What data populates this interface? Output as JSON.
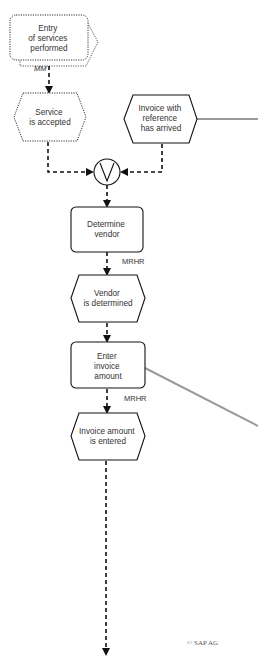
{
  "diagram": {
    "type": "EPC process chain",
    "nodes": [
      {
        "id": "entry-of-services",
        "kind": "process-interface",
        "style": "dotted",
        "lines": [
          "Entry",
          "of services",
          "performed"
        ]
      },
      {
        "id": "service-accepted",
        "kind": "event",
        "style": "dotted",
        "lines": [
          "Service",
          "is accepted"
        ]
      },
      {
        "id": "invoice-arrived",
        "kind": "event",
        "style": "solid",
        "lines": [
          "Invoice with",
          "reference",
          "has arrived"
        ]
      },
      {
        "id": "xor-connector",
        "kind": "connector",
        "symbol": "V"
      },
      {
        "id": "determine-vendor",
        "kind": "function",
        "style": "solid",
        "lines": [
          "Determine",
          "vendor"
        ]
      },
      {
        "id": "vendor-determined",
        "kind": "event",
        "style": "solid",
        "lines": [
          "Vendor",
          "is determined"
        ]
      },
      {
        "id": "enter-invoice-amount",
        "kind": "function",
        "style": "solid",
        "lines": [
          "Enter",
          "invoice",
          "amount"
        ]
      },
      {
        "id": "invoice-amount-entered",
        "kind": "event",
        "style": "solid",
        "lines": [
          "Invoice amount",
          "is entered"
        ]
      }
    ],
    "labels": {
      "mm": "MM",
      "mrhr_1": "MRHR",
      "mrhr_2": "MRHR"
    },
    "copyright": "© SAP AG",
    "colors": {
      "stroke": "#1a1a1a",
      "gray_link": "#9a9a9a",
      "text": "#333333"
    }
  }
}
